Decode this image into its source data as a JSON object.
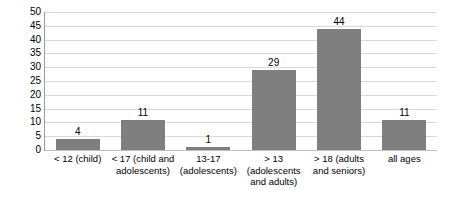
{
  "chart_data": {
    "type": "bar",
    "title": "",
    "subtitle": "",
    "xlabel": "",
    "ylabel": "",
    "ylim": [
      0,
      50
    ],
    "ytick_step": 5,
    "yticks": [
      "0",
      "5",
      "10",
      "15",
      "20",
      "25",
      "30",
      "35",
      "40",
      "45",
      "50"
    ],
    "grid": true,
    "legend": "none",
    "bar_color": "#7f7f7f",
    "gridline_color": "#d9d9d9",
    "axis_color": "#9a9a9a",
    "categories": [
      "< 12 (child)",
      "< 17 (child and\nadolescents)",
      "13-17\n(adolescents)",
      "> 13\n(adolescents\nand adults)",
      "> 18 (adults\nand seniors)",
      "all ages"
    ],
    "values": [
      4,
      11,
      1,
      29,
      44,
      11
    ],
    "data_labels": [
      "4",
      "11",
      "1",
      "29",
      "44",
      "11"
    ]
  }
}
